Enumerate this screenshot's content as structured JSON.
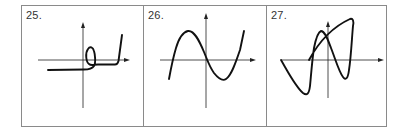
{
  "figure": {
    "panels": [
      {
        "label": "25.",
        "curve_description": "Horizontal line below x-axis crossing y-axis, forming a small loop above x-axis to the right, continuing horizontally, then rising steeply",
        "axes": {
          "x_axis_arrow": true,
          "y_axis_arrow": true
        }
      },
      {
        "label": "26.",
        "curve_description": "Cubic-like curve: rises to a local max left of the y-axis, passes through the origin, dips to a local min right of the y-axis, then rises",
        "axes": {
          "x_axis_arrow": true,
          "y_axis_arrow": true
        }
      },
      {
        "label": "27.",
        "curve_description": "Self-intersecting curve: starts on negative x-axis, dips to a minimum, rises to a peak left of the y-axis, falls to a minimum right of the y-axis, rises to a high peak, then a straight segment returns to the x-axis crossing near the left",
        "axes": {
          "x_axis_arrow": true,
          "y_axis_arrow": true
        }
      }
    ],
    "colors": {
      "border": "#8a8a8a",
      "curve": "#111111",
      "axis": "#222222",
      "label": "#333333"
    }
  }
}
